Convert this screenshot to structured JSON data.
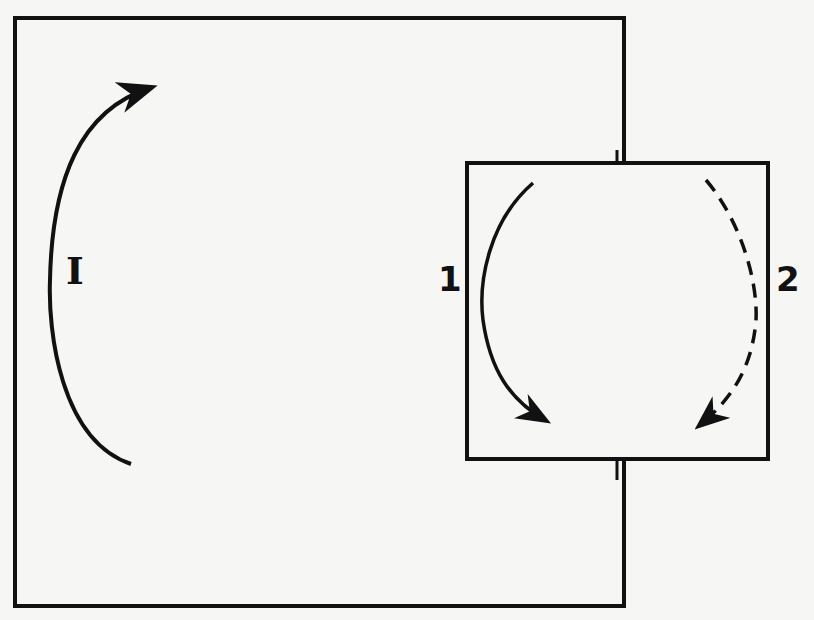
{
  "diagram": {
    "large_region": {
      "label": "I",
      "flow": "counterclockwise upward arc, bottom to top-right"
    },
    "small_region": {
      "flow_1": {
        "label": "1",
        "style": "solid",
        "direction": "downward arc on left side"
      },
      "flow_2": {
        "label": "2",
        "style": "dashed",
        "direction": "downward arc on right side"
      }
    },
    "colors": {
      "stroke": "#111111",
      "background": "#f6f6f4"
    }
  }
}
